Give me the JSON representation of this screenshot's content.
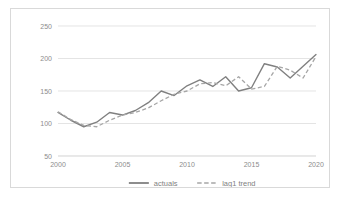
{
  "chart_data": {
    "type": "line",
    "title": "",
    "subtitle": "",
    "xlabel": "",
    "ylabel": "",
    "x": [
      2000,
      2001,
      2002,
      2003,
      2004,
      2005,
      2006,
      2007,
      2008,
      2009,
      2010,
      2011,
      2012,
      2013,
      2014,
      2015,
      2016,
      2017,
      2018,
      2019,
      2020
    ],
    "xlim": [
      2000,
      2020
    ],
    "ylim": [
      50,
      250
    ],
    "xticks": [
      2000,
      2005,
      2010,
      2015,
      2020
    ],
    "xtick_labels": [
      "2000",
      "2005",
      "2010",
      "2015",
      "2020"
    ],
    "yticks": [
      50,
      100,
      150,
      200,
      250
    ],
    "ytick_labels": [
      "50",
      "100",
      "150",
      "200",
      "250"
    ],
    "grid": true,
    "grid_axis": "y",
    "legend_position": "bottom",
    "series": [
      {
        "name": "actuals",
        "style": "solid",
        "color": "#808080",
        "values": [
          117,
          105,
          95,
          102,
          117,
          113,
          120,
          132,
          150,
          143,
          158,
          167,
          157,
          172,
          150,
          155,
          192,
          187,
          170,
          188,
          206
        ]
      },
      {
        "name": "lag1 trend",
        "style": "dashed",
        "color": "#a6a6a6",
        "values": [
          118,
          106,
          97,
          95,
          105,
          113,
          117,
          124,
          135,
          145,
          150,
          161,
          163,
          158,
          172,
          153,
          157,
          188,
          182,
          170,
          203
        ]
      }
    ]
  },
  "legend": {
    "items": [
      {
        "label": "actuals",
        "style": "solid"
      },
      {
        "label": "lag1 trend",
        "style": "dashed"
      }
    ]
  },
  "colors": {
    "actuals": "#808080",
    "lag1_trend": "#a6a6a6",
    "grid": "#d9d9d9",
    "text": "#8c8c8c",
    "frame": "#d9d9d9",
    "background": "#ffffff"
  }
}
